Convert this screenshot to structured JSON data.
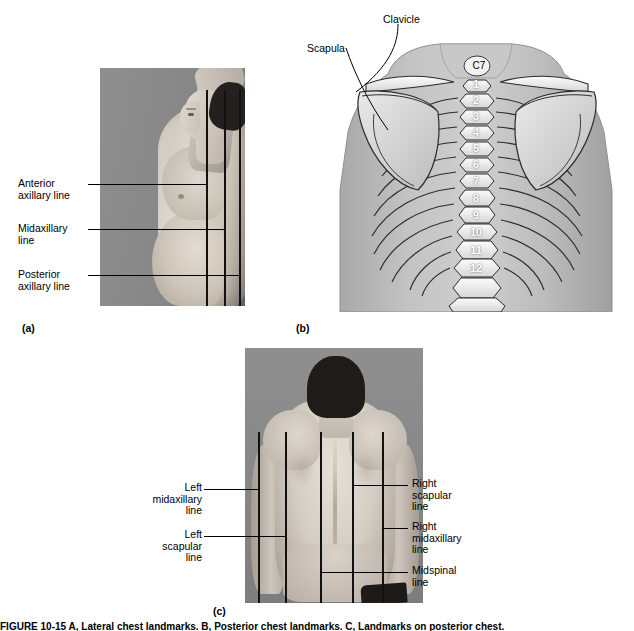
{
  "figure": {
    "caption": "FIGURE 10-15   A, Lateral chest landmarks. B, Posterior chest landmarks. C, Landmarks on posterior chest.",
    "panels": [
      {
        "tag": "(a)",
        "name": "lateral-chest-photo",
        "view": "lateral view of male torso with right arm raised",
        "labels": [
          {
            "id": "anterior-axillary-line",
            "text": "Anterior\naxillary line"
          },
          {
            "id": "midaxillary-line",
            "text": "Midaxillary\nline"
          },
          {
            "id": "posterior-axillary-line",
            "text": "Posterior\naxillary line"
          }
        ],
        "line_count": 3
      },
      {
        "tag": "(b)",
        "name": "posterior-thorax-skeletal-diagram",
        "view": "posterior skeletal illustration of thorax",
        "labels": [
          {
            "id": "clavicle",
            "text": "Clavicle"
          },
          {
            "id": "scapula",
            "text": "Scapula"
          },
          {
            "id": "c7-vertebra",
            "text": "C7"
          }
        ],
        "vertebra_numbers": [
          "1",
          "2",
          "3",
          "4",
          "5",
          "6",
          "7",
          "8",
          "9",
          "10",
          "11",
          "12"
        ]
      },
      {
        "tag": "(c)",
        "name": "posterior-chest-photo",
        "view": "posterior view of male back",
        "labels": [
          {
            "id": "left-midaxillary-line",
            "text": "Left\nmidaxillary\nline"
          },
          {
            "id": "left-scapular-line",
            "text": "Left\nscapular\nline"
          },
          {
            "id": "right-scapular-line",
            "text": "Right\nscapular\nline"
          },
          {
            "id": "right-midaxillary-line",
            "text": "Right\nmidaxillary\nline"
          },
          {
            "id": "midspinal-line",
            "text": "Midspinal\nline"
          }
        ],
        "line_count": 5
      }
    ],
    "colors": {
      "page_background": "#ffffff",
      "photo_background": "#8a8a8a",
      "skin": "#d4ccc2",
      "hair": "#201d1b",
      "landmark_line": "#111111",
      "diagram_bone": "#ffffff",
      "diagram_body": "#b9b9b9",
      "text": "#000000"
    }
  }
}
